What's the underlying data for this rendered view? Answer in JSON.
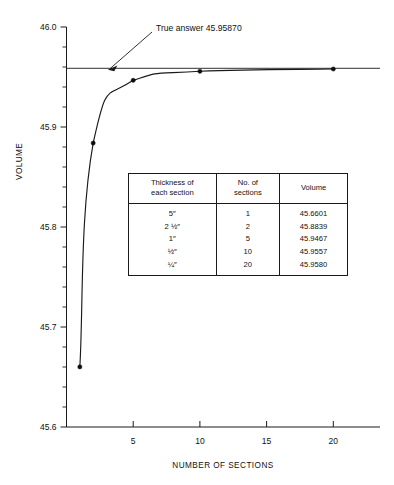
{
  "chart_data": {
    "type": "line",
    "title": "",
    "xlabel": "NUMBER OF SECTIONS",
    "ylabel": "VOLUME",
    "x": [
      1,
      2,
      5,
      10,
      20
    ],
    "values": [
      45.6601,
      45.8839,
      45.9467,
      45.9557,
      45.958
    ],
    "series": [
      {
        "name": "Computed volume",
        "x": [
          1,
          2,
          5,
          10,
          20
        ],
        "values": [
          45.6601,
          45.8839,
          45.9467,
          45.9557,
          45.958
        ]
      }
    ],
    "xlim": [
      0,
      23.5
    ],
    "ylim": [
      45.6,
      46.0
    ],
    "xticks": [
      5,
      10,
      15,
      20
    ],
    "xtick_labels": [
      "5",
      "10",
      "15",
      "20"
    ],
    "yticks": [
      45.6,
      45.7,
      45.8,
      45.9,
      46.0
    ],
    "ytick_labels": [
      "45.6",
      "45.7",
      "45.8",
      "45.9",
      "46.0"
    ],
    "yminor_step": 0.02,
    "grid": false,
    "legend": "none",
    "reference_line": {
      "value": 45.9587,
      "label": "True answer 45.95870"
    },
    "annotation": {
      "text": "True answer 45.95870",
      "points_to_x": 3.1,
      "points_to_y": 45.9587
    }
  },
  "axes": {
    "y_title": "VOLUME",
    "x_title": "NUMBER OF SECTIONS",
    "y_tick_labels": [
      "46.0",
      "45.9",
      "45.8",
      "45.7",
      "45.6"
    ],
    "x_tick_labels": [
      "5",
      "10",
      "15",
      "20"
    ]
  },
  "annotation": {
    "true_answer_label": "True answer 45.95870"
  },
  "table": {
    "headers": [
      "Thickness of each section",
      "No. of sections",
      "Volume"
    ],
    "header_lines": [
      [
        "Thickness of",
        "each section"
      ],
      [
        "No. of",
        "sections"
      ],
      [
        "Volume"
      ]
    ],
    "rows": [
      {
        "thickness": "5″",
        "sections": "1",
        "volume": "45.6601"
      },
      {
        "thickness": "2 ½″",
        "sections": "2",
        "volume": "45.8839"
      },
      {
        "thickness": "1″",
        "sections": "5",
        "volume": "45.9467"
      },
      {
        "thickness": "½″",
        "sections": "10",
        "volume": "45.9557"
      },
      {
        "thickness": "¼″",
        "sections": "20",
        "volume": "45.9580"
      }
    ]
  },
  "colors": {
    "ink": "#1a1a1a",
    "background": "#ffffff"
  }
}
